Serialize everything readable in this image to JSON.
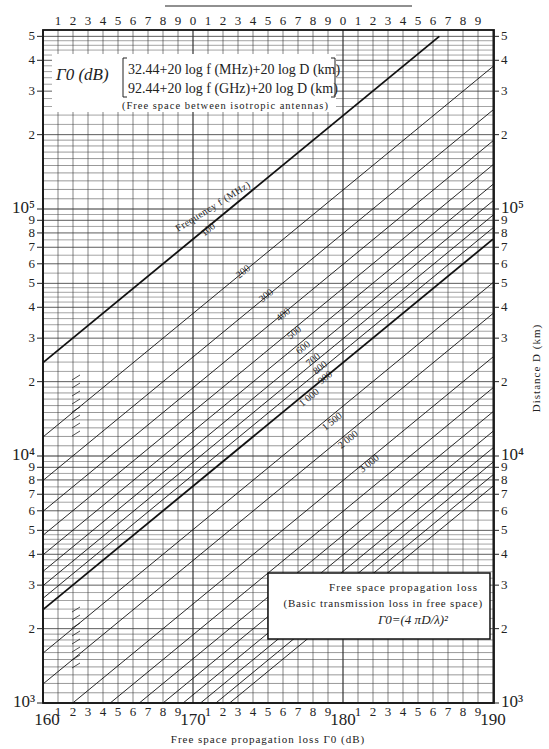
{
  "chart_data": {
    "type": "line",
    "title": "Free space propagation loss",
    "subtitle": "(Basic transmission loss in free space)",
    "formula_box": "Γ0=(4 πD/λ)²",
    "legend_header": "Γ0 (dB)",
    "legend_formula_1": "32.44+20 log f (MHz)+20 log D (km)",
    "legend_formula_2": "92.44+20 log f (GHz)+20 log D (km)",
    "legend_note": "(Free space between isotropic antennas)",
    "curve_family_label": "Frequency f (MHz)",
    "xlabel": "Free space propagation loss Γ0 (dB)",
    "ylabel": "Distance D (km)",
    "xlim": [
      160,
      190
    ],
    "ylim": [
      1000,
      500000
    ],
    "yscale": "log",
    "x_major_ticks": [
      "160",
      "170",
      "180",
      "190"
    ],
    "x_minor_ticks": [
      "1",
      "2",
      "3",
      "4",
      "5",
      "6",
      "7",
      "8",
      "9"
    ],
    "top_ticks": [
      "1",
      "2",
      "3",
      "4",
      "5",
      "6",
      "7",
      "8",
      "9",
      "0",
      "1",
      "2",
      "3",
      "4",
      "5",
      "6",
      "7",
      "8",
      "9",
      "0",
      "1",
      "2",
      "3",
      "4",
      "5",
      "6",
      "7",
      "8",
      "9"
    ],
    "y_ticks_left": [
      "10³",
      "2",
      "3",
      "4",
      "5",
      "6",
      "7",
      "8",
      "9",
      "10⁴",
      "2",
      "3",
      "4",
      "5",
      "6",
      "7",
      "8",
      "9",
      "10⁵",
      "2",
      "3",
      "4",
      "5"
    ],
    "grid": true,
    "series": [
      {
        "name": "100",
        "f_mhz": 100,
        "heavy": true,
        "label_shown": true
      },
      {
        "name": "200",
        "f_mhz": 200,
        "label_shown": true
      },
      {
        "name": "300",
        "f_mhz": 300,
        "label_shown": true
      },
      {
        "name": "400",
        "f_mhz": 400,
        "label_shown": true
      },
      {
        "name": "500",
        "f_mhz": 500,
        "label_shown": true
      },
      {
        "name": "600",
        "f_mhz": 600,
        "label_shown": true
      },
      {
        "name": "700",
        "f_mhz": 700,
        "label_shown": true
      },
      {
        "name": "800",
        "f_mhz": 800,
        "label_shown": true
      },
      {
        "name": "900",
        "f_mhz": 900,
        "label_shown": true
      },
      {
        "name": "1 000",
        "f_mhz": 1000,
        "heavy": true,
        "label_shown": true
      },
      {
        "name": "1 500",
        "f_mhz": 1500,
        "label_shown": true
      },
      {
        "name": "2 000",
        "f_mhz": 2000,
        "label_shown": true
      },
      {
        "name": "3 000",
        "f_mhz": 3000,
        "label_shown": true
      },
      {
        "name": "4 000",
        "f_mhz": 4000
      },
      {
        "name": "5 000",
        "f_mhz": 5000
      },
      {
        "name": "6 000",
        "f_mhz": 6000
      },
      {
        "name": "7 000",
        "f_mhz": 7000
      },
      {
        "name": "8 000",
        "f_mhz": 8000
      },
      {
        "name": "9 000",
        "f_mhz": 9000
      },
      {
        "name": "10 000",
        "f_mhz": 10000
      }
    ],
    "model": "Γ0 = 32.44 + 20 log10 f(MHz) + 20 log10 D(km)"
  }
}
